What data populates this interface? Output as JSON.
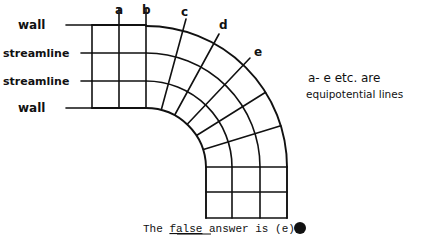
{
  "labels": {
    "wall_top": "wall",
    "streamline_1": "streamline",
    "streamline_2": "streamline",
    "wall_bottom": "wall"
  },
  "equipotential_labels": [
    "a",
    "b",
    "c",
    "d",
    "e"
  ],
  "note": {
    "line1": "a- e  etc. are",
    "line2": "equipotential lines"
  },
  "answer": {
    "prefix": "The ",
    "underlined": "false",
    "suffix": " answer is (e)",
    "marker": "filled-circle"
  },
  "colors": {
    "ink": "#111111",
    "background": "#ffffff"
  }
}
